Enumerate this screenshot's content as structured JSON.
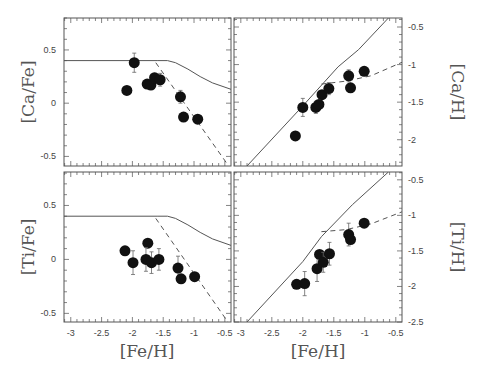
{
  "chart_data": [
    {
      "type": "scatter",
      "panel": "top-left",
      "xlabel": "",
      "ylabel": "[Ca/Fe]",
      "xlim": [
        -3.11,
        -0.4
      ],
      "ylim": [
        -0.59,
        0.8
      ],
      "yticks": [
        0.5,
        0,
        -0.5
      ],
      "ytick_labels": [
        "0.5",
        "0",
        "-0.5"
      ],
      "xticks": [],
      "ylabel_side": "left",
      "rect": {
        "x": 64,
        "y": 18,
        "w": 167,
        "h": 148
      },
      "points": [
        {
          "x": -2.09,
          "y": 0.12,
          "err": 0
        },
        {
          "x": -1.97,
          "y": 0.38,
          "err": 0.09
        },
        {
          "x": -1.76,
          "y": 0.18,
          "err": 0.04
        },
        {
          "x": -1.7,
          "y": 0.17,
          "err": 0
        },
        {
          "x": -1.64,
          "y": 0.24,
          "err": 0.04
        },
        {
          "x": -1.55,
          "y": 0.22,
          "err": 0.06
        },
        {
          "x": -1.22,
          "y": 0.06,
          "err": 0.06
        },
        {
          "x": -1.17,
          "y": -0.13,
          "err": 0
        },
        {
          "x": -0.94,
          "y": -0.15,
          "err": 0
        }
      ],
      "solid_model": [
        [
          -3.11,
          0.4
        ],
        [
          -1.6,
          0.4
        ],
        [
          -1.43,
          0.4
        ],
        [
          -1.3,
          0.38
        ],
        [
          -1.1,
          0.32
        ],
        [
          -0.9,
          0.25
        ],
        [
          -0.7,
          0.19
        ],
        [
          -0.4,
          0.13
        ]
      ],
      "dashed_model": [
        [
          -1.62,
          0.38
        ],
        [
          -0.45,
          -0.58
        ]
      ]
    },
    {
      "type": "scatter",
      "panel": "top-right",
      "xlabel": "",
      "ylabel": "[Ca/H]",
      "xlim": [
        -3.11,
        -0.4
      ],
      "ylim": [
        -2.35,
        -0.38
      ],
      "yticks": [
        -0.5,
        -1,
        -1.5,
        -2
      ],
      "ytick_labels": [
        "-0.5",
        "-1",
        "-1.5",
        "-2"
      ],
      "xticks": [],
      "ylabel_side": "right",
      "rect": {
        "x": 234,
        "y": 18,
        "w": 168,
        "h": 148
      },
      "points": [
        {
          "x": -2.12,
          "y": -1.95,
          "err": 0
        },
        {
          "x": -2.0,
          "y": -1.57,
          "err": 0.12
        },
        {
          "x": -1.79,
          "y": -1.57,
          "err": 0.08
        },
        {
          "x": -1.74,
          "y": -1.53,
          "err": 0
        },
        {
          "x": -1.69,
          "y": -1.4,
          "err": 0
        },
        {
          "x": -1.58,
          "y": -1.32,
          "err": 0.08
        },
        {
          "x": -1.26,
          "y": -1.15,
          "err": 0.08
        },
        {
          "x": -1.23,
          "y": -1.31,
          "err": 0
        },
        {
          "x": -1.01,
          "y": -1.09,
          "err": 0
        }
      ],
      "solid_model": [
        [
          -2.9,
          -2.35
        ],
        [
          -2.0,
          -1.55
        ],
        [
          -1.43,
          -1.03
        ],
        [
          -1.1,
          -0.8
        ],
        [
          -0.62,
          -0.38
        ]
      ],
      "dashed_model": [
        [
          -1.7,
          -1.26
        ],
        [
          -1.3,
          -1.22
        ],
        [
          -0.9,
          -1.15
        ],
        [
          -0.4,
          -0.97
        ]
      ]
    },
    {
      "type": "scatter",
      "panel": "bottom-left",
      "xlabel": "[Fe/H]",
      "ylabel": "[Ti/Fe]",
      "xlim": [
        -3.11,
        -0.4
      ],
      "ylim": [
        -0.58,
        0.81
      ],
      "yticks": [
        0.5,
        0,
        -0.5
      ],
      "ytick_labels": [
        "0.5",
        "0",
        "-0.5"
      ],
      "xticks": [
        -3,
        -2.5,
        -2,
        -1.5,
        -1,
        -0.5
      ],
      "xtick_labels": [
        "-3",
        "-2.5",
        "-2",
        "-1.5",
        "-1",
        "-0.5"
      ],
      "ylabel_side": "left",
      "rect": {
        "x": 64,
        "y": 172,
        "w": 167,
        "h": 150
      },
      "points": [
        {
          "x": -2.12,
          "y": 0.08,
          "err": 0
        },
        {
          "x": -1.99,
          "y": -0.03,
          "err": 0.11
        },
        {
          "x": -1.75,
          "y": 0.15,
          "err": 0
        },
        {
          "x": -1.78,
          "y": 0.0,
          "err": 0.11
        },
        {
          "x": -1.69,
          "y": -0.03,
          "err": 0.1
        },
        {
          "x": -1.57,
          "y": 0.0,
          "err": 0.1
        },
        {
          "x": -1.26,
          "y": -0.08,
          "err": 0.11
        },
        {
          "x": -1.21,
          "y": -0.18,
          "err": 0
        },
        {
          "x": -0.99,
          "y": -0.16,
          "err": 0
        }
      ],
      "solid_model": [
        [
          -3.11,
          0.4
        ],
        [
          -1.6,
          0.4
        ],
        [
          -1.43,
          0.4
        ],
        [
          -1.3,
          0.38
        ],
        [
          -1.1,
          0.32
        ],
        [
          -0.9,
          0.25
        ],
        [
          -0.7,
          0.19
        ],
        [
          -0.4,
          0.13
        ]
      ],
      "dashed_model": [
        [
          -1.62,
          0.38
        ],
        [
          -0.45,
          -0.58
        ]
      ]
    },
    {
      "type": "scatter",
      "panel": "bottom-right",
      "xlabel": "[Fe/H]",
      "ylabel": "[Ti/H]",
      "xlim": [
        -3.11,
        -0.4
      ],
      "ylim": [
        -2.5,
        -0.39
      ],
      "yticks": [
        -0.5,
        -1,
        -1.5,
        -2,
        -2.5
      ],
      "ytick_labels": [
        "-0.5",
        "-1",
        "-1.5",
        "-2",
        "-2.5"
      ],
      "xticks": [
        -3,
        -2.5,
        -2,
        -1.5,
        -1,
        -0.5
      ],
      "xtick_labels": [
        "-3",
        "-2.5",
        "-2",
        "-1.5",
        "-1",
        "-0.5"
      ],
      "ylabel_side": "right",
      "rect": {
        "x": 234,
        "y": 172,
        "w": 168,
        "h": 150
      },
      "points": [
        {
          "x": -2.1,
          "y": -1.97,
          "err": 0
        },
        {
          "x": -1.97,
          "y": -1.96,
          "err": 0.17
        },
        {
          "x": -1.77,
          "y": -1.75,
          "err": 0.18
        },
        {
          "x": -1.73,
          "y": -1.55,
          "err": 0
        },
        {
          "x": -1.67,
          "y": -1.66,
          "err": 0.14
        },
        {
          "x": -1.57,
          "y": -1.54,
          "err": 0.16
        },
        {
          "x": -1.26,
          "y": -1.27,
          "err": 0.16
        },
        {
          "x": -1.23,
          "y": -1.34,
          "err": 0
        },
        {
          "x": -1.01,
          "y": -1.11,
          "err": 0
        }
      ],
      "solid_model": [
        [
          -2.9,
          -2.5
        ],
        [
          -2.0,
          -1.65
        ],
        [
          -1.7,
          -1.3
        ],
        [
          -1.2,
          -0.85
        ],
        [
          -0.62,
          -0.39
        ]
      ],
      "dashed_model": [
        [
          -1.7,
          -1.23
        ],
        [
          -1.3,
          -1.2
        ],
        [
          -0.9,
          -1.12
        ],
        [
          -0.4,
          -0.95
        ]
      ]
    }
  ],
  "labels": {
    "ca_fe": "[Ca/Fe]",
    "ca_h": "[Ca/H]",
    "ti_fe": "[Ti/Fe]",
    "ti_h": "[Ti/H]",
    "fe_h_left": "[Fe/H]",
    "fe_h_right": "[Fe/H]"
  }
}
